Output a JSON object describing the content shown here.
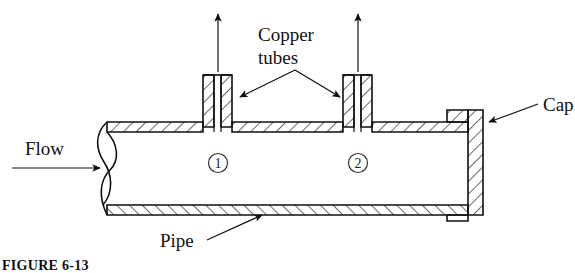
{
  "figure": {
    "caption": "FIGURE  6-13",
    "labels": {
      "copper_tubes_line1": "Copper",
      "copper_tubes_line2": "tubes",
      "cap": "Cap",
      "flow": "Flow",
      "pipe": "Pipe",
      "station_1": "1",
      "station_2": "2"
    },
    "icons": {
      "flow_arrow": "right-arrow-icon",
      "tube1_outflow_arrow": "up-arrow-icon",
      "tube2_outflow_arrow": "up-arrow-icon",
      "copper_leader_left": "leader-arrow-icon",
      "copper_leader_right": "leader-arrow-icon",
      "cap_leader": "leader-arrow-icon",
      "pipe_leader": "leader-arrow-icon",
      "break_line": "break-line-icon"
    },
    "colors": {
      "line": "#111111",
      "hatch": "#111111",
      "background": "#ffffff",
      "text": "#111111"
    }
  }
}
